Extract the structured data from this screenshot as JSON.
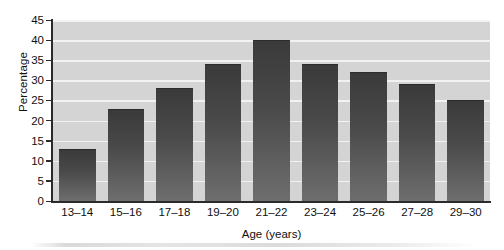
{
  "chart_data": {
    "type": "bar",
    "title": "",
    "categories": [
      "13–14",
      "15–16",
      "17–18",
      "19–20",
      "21–22",
      "23–24",
      "25–26",
      "27–28",
      "29–30"
    ],
    "values": [
      13,
      23,
      28,
      34,
      40,
      34,
      32,
      29,
      25
    ],
    "xlabel": "Age (years)",
    "ylabel": "Percentage",
    "ylim": [
      0,
      45
    ],
    "ytick_labels": [
      "0",
      "5",
      "10",
      "15",
      "20",
      "25",
      "30",
      "35",
      "40",
      "45"
    ],
    "ytick_values": [
      0,
      5,
      10,
      15,
      20,
      25,
      30,
      35,
      40,
      45
    ],
    "ytick_step": 5,
    "grid": "horizontal",
    "legend": "none",
    "colors": {
      "bar_top": "#3a3a3a",
      "bar_bottom": "#6e6e6e",
      "plot_background": "#d4d4d4",
      "gridline": "#f2f2f2",
      "axis": "#2b2b2b",
      "text": "#101010",
      "page_background": "#ffffff"
    }
  }
}
